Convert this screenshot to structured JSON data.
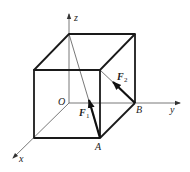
{
  "diagram": {
    "type": "3d-cube-force-vectors",
    "colors": {
      "line": "#1a1a1a",
      "axis": "#555555",
      "background": "#ffffff"
    },
    "axes": {
      "x": "x",
      "y": "y",
      "z": "z",
      "origin": "O"
    },
    "points": {
      "A": "A",
      "B": "B"
    },
    "forces": [
      {
        "name": "F",
        "sub": "1",
        "from": "A",
        "direction": "toward top-back-left vertex (on z-axis)"
      },
      {
        "name": "F",
        "sub": "2",
        "from": "B",
        "direction": "toward top-front-right vertex"
      }
    ]
  }
}
